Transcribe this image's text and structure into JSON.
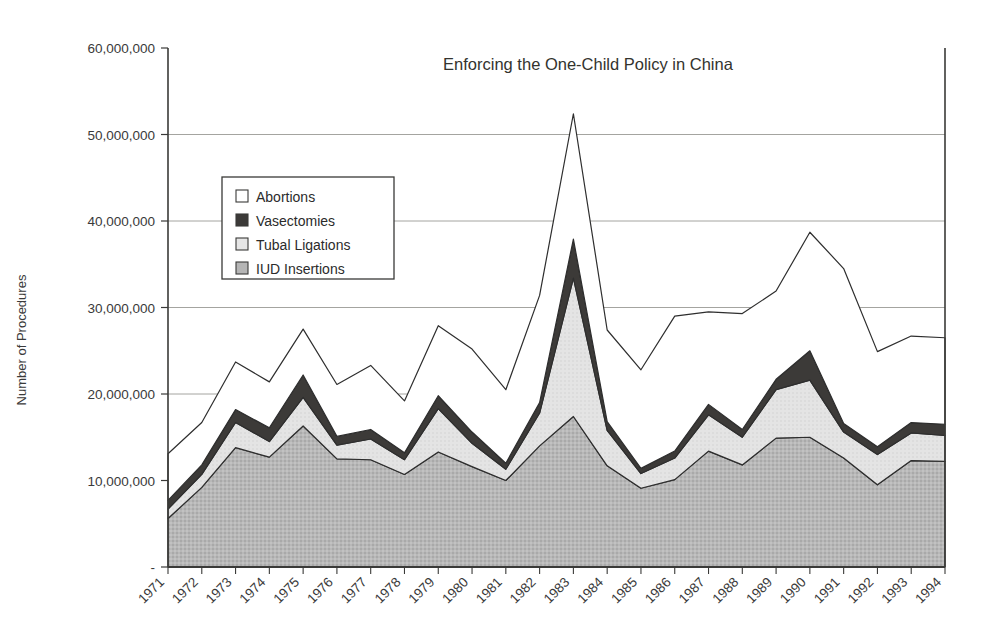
{
  "chart_data": {
    "type": "area",
    "title": "Enforcing the One-Child Policy in China",
    "xlabel": "",
    "ylabel": "Number of Procedures",
    "stacked": true,
    "grid": true,
    "legend_position": "inside-upper-left",
    "ylim": [
      0,
      60000000
    ],
    "yticks": [
      0,
      10000000,
      20000000,
      30000000,
      40000000,
      50000000,
      60000000
    ],
    "ytick_labels": [
      "-",
      "10,000,000",
      "20,000,000",
      "30,000,000",
      "40,000,000",
      "50,000,000",
      "60,000,000"
    ],
    "categories": [
      "1971",
      "1972",
      "1973",
      "1974",
      "1975",
      "1976",
      "1977",
      "1978",
      "1979",
      "1980",
      "1981",
      "1982",
      "1983",
      "1984",
      "1985",
      "1986",
      "1987",
      "1988",
      "1989",
      "1990",
      "1991",
      "1992",
      "1993",
      "1994"
    ],
    "series": [
      {
        "name": "IUD Insertions",
        "color": "#b5b5b5",
        "values": [
          5600000,
          9200000,
          13800000,
          12700000,
          16300000,
          12500000,
          12400000,
          10700000,
          13300000,
          11600000,
          10000000,
          14000000,
          17400000,
          11700000,
          9100000,
          10100000,
          13400000,
          11800000,
          14900000,
          15000000,
          12600000,
          9500000,
          12300000,
          12200000
        ]
      },
      {
        "name": "Tubal Ligations",
        "color": "#e2e2e2",
        "values": [
          1100000,
          1500000,
          2900000,
          1800000,
          3300000,
          1600000,
          2400000,
          1700000,
          5000000,
          2700000,
          1300000,
          3800000,
          16000000,
          4100000,
          1700000,
          2500000,
          4200000,
          3200000,
          5600000,
          6600000,
          3000000,
          3500000,
          3200000,
          3000000
        ]
      },
      {
        "name": "Vasectomies",
        "color": "#3c3a38",
        "values": [
          1000000,
          1100000,
          1500000,
          1600000,
          2600000,
          1000000,
          1100000,
          800000,
          1500000,
          1300000,
          700000,
          1200000,
          4500000,
          1000000,
          600000,
          800000,
          1200000,
          900000,
          1200000,
          3400000,
          1000000,
          900000,
          1200000,
          1300000
        ]
      },
      {
        "name": "Abortions",
        "color": "#ffffff",
        "values": [
          5400000,
          4900000,
          5500000,
          5300000,
          5300000,
          6000000,
          7400000,
          6000000,
          8100000,
          9600000,
          8500000,
          12400000,
          14500000,
          10600000,
          11400000,
          15600000,
          10700000,
          13400000,
          10200000,
          13700000,
          17900000,
          11000000,
          10000000,
          10000000
        ]
      }
    ],
    "totals": [
      13100000,
      16700000,
      23700000,
      21400000,
      27500000,
      21100000,
      23300000,
      19200000,
      27900000,
      25200000,
      20500000,
      31400000,
      52400000,
      27400000,
      22800000,
      29000000,
      29500000,
      29300000,
      31900000,
      38700000,
      34500000,
      24900000,
      26700000,
      26500000
    ]
  },
  "legend": {
    "items": [
      {
        "label": "Abortions",
        "swatch": "#ffffff"
      },
      {
        "label": "Vasectomies",
        "swatch": "#3c3a38"
      },
      {
        "label": "Tubal Ligations",
        "swatch": "#e6e6e6"
      },
      {
        "label": "IUD Insertions",
        "swatch": "#b5b5b5"
      }
    ]
  }
}
